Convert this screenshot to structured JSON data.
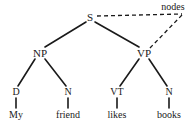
{
  "diagram": {
    "type": "syntax-tree",
    "sentence": "My friend likes books",
    "background_color": "#ffffff",
    "line_color": "#1a1a1a",
    "annotation": {
      "label": "nodes",
      "x": 173,
      "y": 7,
      "style": "dashed"
    },
    "nodes": [
      {
        "id": "S",
        "label": "S",
        "x": 90,
        "y": 17,
        "level": "root"
      },
      {
        "id": "NP",
        "label": "NP",
        "x": 40,
        "y": 53,
        "level": "phrase"
      },
      {
        "id": "VP",
        "label": "VP",
        "x": 144,
        "y": 53,
        "level": "phrase"
      },
      {
        "id": "D",
        "label": "D",
        "x": 16,
        "y": 92,
        "level": "pos"
      },
      {
        "id": "N1",
        "label": "N",
        "x": 68,
        "y": 92,
        "level": "pos"
      },
      {
        "id": "VT",
        "label": "VT",
        "x": 117,
        "y": 92,
        "level": "pos"
      },
      {
        "id": "N2",
        "label": "N",
        "x": 169,
        "y": 92,
        "level": "pos"
      },
      {
        "id": "My",
        "label": "My",
        "x": 16,
        "y": 115,
        "level": "word"
      },
      {
        "id": "friend",
        "label": "friend",
        "x": 68,
        "y": 115,
        "level": "word"
      },
      {
        "id": "likes",
        "label": "likes",
        "x": 117,
        "y": 115,
        "level": "word"
      },
      {
        "id": "books",
        "label": "books",
        "x": 169,
        "y": 115,
        "level": "word"
      }
    ],
    "edges": [
      {
        "from": "S",
        "to": "NP",
        "x1": 86,
        "y1": 22,
        "x2": 45,
        "y2": 47,
        "style": "solid"
      },
      {
        "from": "S",
        "to": "VP",
        "x1": 95,
        "y1": 22,
        "x2": 139,
        "y2": 47,
        "style": "solid"
      },
      {
        "from": "NP",
        "to": "D",
        "x1": 35,
        "y1": 59,
        "x2": 18,
        "y2": 86,
        "style": "solid"
      },
      {
        "from": "NP",
        "to": "N1",
        "x1": 45,
        "y1": 59,
        "x2": 66,
        "y2": 86,
        "style": "solid"
      },
      {
        "from": "VP",
        "to": "VT",
        "x1": 139,
        "y1": 59,
        "x2": 120,
        "y2": 86,
        "style": "solid"
      },
      {
        "from": "VP",
        "to": "N2",
        "x1": 149,
        "y1": 59,
        "x2": 167,
        "y2": 86,
        "style": "solid"
      },
      {
        "from": "D",
        "to": "My",
        "x1": 16,
        "y1": 98,
        "x2": 16,
        "y2": 108,
        "style": "solid"
      },
      {
        "from": "N1",
        "to": "friend",
        "x1": 68,
        "y1": 98,
        "x2": 68,
        "y2": 108,
        "style": "solid"
      },
      {
        "from": "VT",
        "to": "likes",
        "x1": 117,
        "y1": 98,
        "x2": 117,
        "y2": 108,
        "style": "solid"
      },
      {
        "from": "N2",
        "to": "books",
        "x1": 169,
        "y1": 98,
        "x2": 169,
        "y2": 108,
        "style": "solid"
      }
    ],
    "annotation_edges": [
      {
        "from": "S",
        "to": "nodes",
        "x1": 97,
        "y1": 16,
        "x2": 182,
        "y2": 14,
        "style": "dashed"
      },
      {
        "from": "nodes",
        "to": "VP",
        "x1": 182,
        "y1": 15,
        "x2": 149,
        "y2": 49,
        "style": "dashed"
      }
    ]
  }
}
